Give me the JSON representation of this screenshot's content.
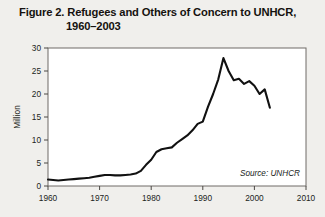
{
  "figure": {
    "title_line1": "Figure 2. Refugees and Others of Concern to UNHCR,",
    "title_line2": "1960–2003",
    "source_note": "Source: UNHCR"
  },
  "chart_data": {
    "type": "line",
    "title": "Figure 2. Refugees and Others of Concern to UNHCR, 1960–2003",
    "xlabel": "",
    "ylabel": "Million",
    "xlim": [
      1960,
      2010
    ],
    "ylim": [
      0,
      30
    ],
    "xticks": [
      1960,
      1970,
      1980,
      1990,
      2000,
      2010
    ],
    "xtick_labels": [
      "1960",
      "1970",
      "1980",
      "1990",
      "2000",
      "2010"
    ],
    "yticks": [
      0,
      5,
      10,
      15,
      20,
      25,
      30
    ],
    "ytick_labels": [
      "0",
      "5",
      "10",
      "15",
      "20",
      "25",
      "30"
    ],
    "grid": false,
    "legend": false,
    "line_color": "#111111",
    "line_width": 2.1,
    "series": [
      {
        "name": "Refugees and Others of Concern to UNHCR",
        "x": [
          1960,
          1961,
          1962,
          1963,
          1964,
          1965,
          1966,
          1967,
          1968,
          1969,
          1970,
          1971,
          1972,
          1973,
          1974,
          1975,
          1976,
          1977,
          1978,
          1979,
          1980,
          1981,
          1982,
          1983,
          1984,
          1985,
          1986,
          1987,
          1988,
          1989,
          1990,
          1991,
          1992,
          1993,
          1994,
          1995,
          1996,
          1997,
          1998,
          1999,
          2000,
          2001,
          2002,
          2003
        ],
        "values": [
          1.4,
          1.3,
          1.2,
          1.3,
          1.4,
          1.5,
          1.6,
          1.7,
          1.8,
          2.0,
          2.2,
          2.4,
          2.4,
          2.3,
          2.3,
          2.4,
          2.5,
          2.7,
          3.3,
          4.6,
          5.7,
          7.4,
          8.0,
          8.2,
          8.4,
          9.4,
          10.2,
          11.0,
          12.1,
          13.5,
          14.0,
          17.2,
          20.0,
          23.2,
          27.8,
          25.0,
          23.0,
          23.3,
          22.2,
          22.8,
          21.8,
          20.0,
          21.0,
          17.0
        ]
      }
    ]
  }
}
